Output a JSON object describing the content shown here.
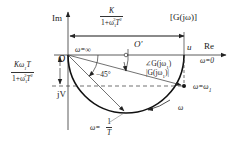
{
  "figure": {
    "type": "Nyquist plot (polar plot) of first-order inertial element",
    "axes": {
      "imag_label": "Im",
      "real_label": "Re",
      "origin_label": "O",
      "center_label": "O'",
      "real_intercept_label": "u",
      "imag_component_label": "jV"
    },
    "labels": {
      "function": "[G(jω)]",
      "omega_infinity": "ω=∞",
      "omega_zero": "ω=0",
      "omega_one": "ω=ω",
      "omega_one_sub": "1",
      "omega_corner_prefix": "ω=",
      "omega_corner_num": "1",
      "omega_corner_den": "T",
      "angle": "−45°",
      "phase_label": "∠G(jω",
      "phase_label_sub": "1",
      "phase_label_end": ")",
      "magnitude_label": "|G(jω",
      "magnitude_label_sub": "1",
      "magnitude_label_end": ")|",
      "direction": "ω"
    },
    "real_part_fraction": {
      "num": "K",
      "den_prefix": "1+ω",
      "den_sub": "1",
      "den_sup": "2",
      "den_suffix": "T",
      "den_suffix_sup": "2"
    },
    "imag_part_fraction": {
      "num_prefix": "Kω",
      "num_sub": "1",
      "num_suffix": "T",
      "den_prefix": "1+ω",
      "den_sub": "1",
      "den_sup": "2",
      "den_suffix": "T",
      "den_suffix_sup": "2"
    },
    "colors": {
      "line": "#222222",
      "thin": "#444444",
      "background": "#ffffff"
    }
  }
}
